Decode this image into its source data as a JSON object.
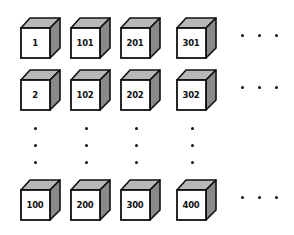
{
  "diagram": {
    "colors": {
      "front_face": "#ffffff",
      "top_face": "#b8b8b8",
      "side_face": "#8a8a8a",
      "outline": "#111111",
      "dots": "#111111"
    },
    "columns": [
      {
        "cubes": [
          {
            "label": "1",
            "x": 20,
            "y": 17
          },
          {
            "label": "2",
            "x": 20,
            "y": 69
          },
          {
            "label": "100",
            "x": 20,
            "y": 179
          }
        ]
      },
      {
        "cubes": [
          {
            "label": "101",
            "x": 70,
            "y": 17
          },
          {
            "label": "102",
            "x": 70,
            "y": 69
          },
          {
            "label": "200",
            "x": 70,
            "y": 179
          }
        ]
      },
      {
        "cubes": [
          {
            "label": "201",
            "x": 120,
            "y": 17
          },
          {
            "label": "202",
            "x": 120,
            "y": 69
          },
          {
            "label": "300",
            "x": 120,
            "y": 179
          }
        ]
      },
      {
        "cubes": [
          {
            "label": "301",
            "x": 176,
            "y": 17
          },
          {
            "label": "302",
            "x": 176,
            "y": 69
          },
          {
            "label": "400",
            "x": 176,
            "y": 179
          }
        ]
      }
    ],
    "vertical_ellipses": [
      {
        "x": 34,
        "ys": [
          127,
          144,
          161
        ]
      },
      {
        "x": 85,
        "ys": [
          127,
          144,
          161
        ]
      },
      {
        "x": 135,
        "ys": [
          127,
          144,
          161
        ]
      },
      {
        "x": 191,
        "ys": [
          127,
          144,
          161
        ]
      }
    ],
    "horizontal_ellipses": [
      {
        "y": 34,
        "xs": [
          241,
          258,
          275
        ]
      },
      {
        "y": 86,
        "xs": [
          241,
          258,
          275
        ]
      },
      {
        "y": 196,
        "xs": [
          241,
          258,
          275
        ]
      }
    ]
  }
}
